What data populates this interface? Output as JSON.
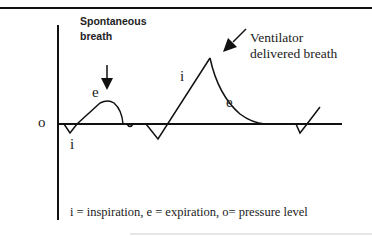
{
  "diagram": {
    "labels": {
      "spontaneous_line1": "Spontaneous",
      "spontaneous_line2": "breath",
      "ventilator_line1": "Ventilator",
      "ventilator_line2": "delivered breath",
      "baseline_marker": "o",
      "spont_expiration": "e",
      "spont_inspiration": "i",
      "vent_inspiration": "i",
      "vent_expiration": "e"
    },
    "legend": "i = inspiration, e = expiration, o= pressure level",
    "colors": {
      "line": "#111111",
      "text": "#222222",
      "background": "#ffffff"
    }
  }
}
